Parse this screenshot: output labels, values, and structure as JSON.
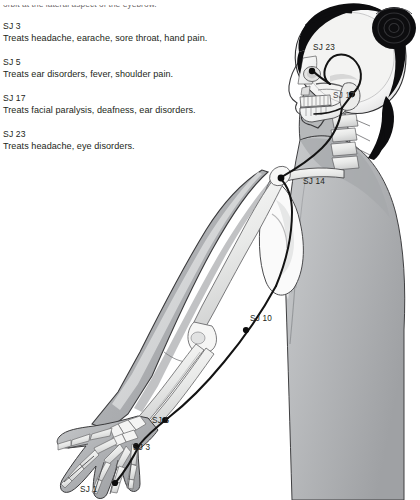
{
  "page": {
    "truncated_top_line": "orbit at the lateral aspect of the eyebrow.",
    "entries": [
      {
        "code": "SJ 3",
        "description": "Treats headache, earache, sore throat, hand pain."
      },
      {
        "code": "SJ 5",
        "description": "Treats ear disorders, fever, shoulder pain."
      },
      {
        "code": "SJ 17",
        "description": "Treats facial paralysis, deafness, ear disorders."
      },
      {
        "code": "SJ 23",
        "description": "Treats headache, eye disorders."
      }
    ]
  },
  "illustration": {
    "title": "Sanjiao (Triple Burner) meridian of the arm, shoulder and head",
    "point_labels": {
      "sj23": "SJ 23",
      "sj17": "SJ 17",
      "sj14": "SJ 14",
      "sj10": "SJ 10",
      "sj5": "SJ 5",
      "sj3": "SJ 3",
      "sj1": "SJ 1"
    },
    "colors": {
      "background": "#ffffff",
      "skin_tone": "#b9bbbd",
      "skin_shadow": "#9b9da0",
      "bone_light": "#f2f2f1",
      "bone_mid": "#d6d7d8",
      "hair": "#0d0d0f",
      "meridian_line": "#131313",
      "outline": "#3a3a3c",
      "text": "#231f20"
    }
  }
}
